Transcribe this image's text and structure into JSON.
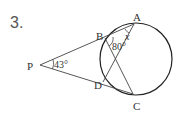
{
  "problem": {
    "number": "3.",
    "points": {
      "A": "A",
      "B": "B",
      "C": "C",
      "D": "D",
      "P": "P"
    },
    "angles": {
      "P": "43°",
      "B": "80°",
      "A": "x"
    }
  }
}
